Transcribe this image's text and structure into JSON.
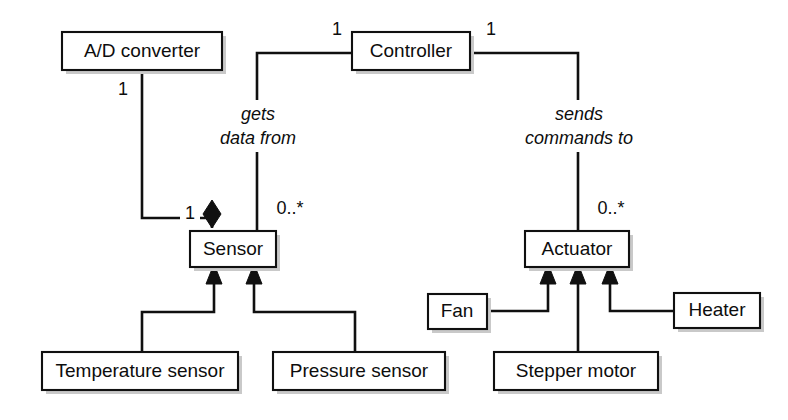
{
  "diagram": {
    "kind": "uml-class-diagram",
    "background_color": "#ffffff",
    "line_color": "#101010",
    "box_fill_color": "#ffffff",
    "text_color": "#0d0d0d"
  },
  "classes": [
    {
      "id": "ad_converter",
      "name": "A/D converter"
    },
    {
      "id": "controller",
      "name": "Controller"
    },
    {
      "id": "sensor",
      "name": "Sensor"
    },
    {
      "id": "actuator",
      "name": "Actuator"
    },
    {
      "id": "temperature_sensor",
      "name": "Temperature sensor"
    },
    {
      "id": "pressure_sensor",
      "name": "Pressure sensor"
    },
    {
      "id": "fan",
      "name": "Fan"
    },
    {
      "id": "stepper_motor",
      "name": "Stepper motor"
    },
    {
      "id": "heater",
      "name": "Heater"
    }
  ],
  "associations": [
    {
      "id": "ad_to_sensor",
      "type": "composition",
      "from": "A/D converter",
      "to": "Sensor",
      "source_multiplicity": "1",
      "target_multiplicity": "1",
      "label": ""
    },
    {
      "id": "controller_to_sensor",
      "type": "association",
      "from": "Controller",
      "to": "Sensor",
      "source_multiplicity": "1",
      "target_multiplicity": "0..*",
      "label_line1": "gets",
      "label_line2": "data from"
    },
    {
      "id": "controller_to_actuator",
      "type": "association",
      "from": "Controller",
      "to": "Actuator",
      "source_multiplicity": "1",
      "target_multiplicity": "0..*",
      "label_line1": "sends",
      "label_line2": "commands to"
    }
  ],
  "generalizations": [
    {
      "id": "temp_to_sensor",
      "subclass": "Temperature sensor",
      "superclass": "Sensor"
    },
    {
      "id": "press_to_sensor",
      "subclass": "Pressure sensor",
      "superclass": "Sensor"
    },
    {
      "id": "fan_to_actuator",
      "subclass": "Fan",
      "superclass": "Actuator"
    },
    {
      "id": "stepper_to_actuator",
      "subclass": "Stepper motor",
      "superclass": "Actuator"
    },
    {
      "id": "heater_to_actuator",
      "subclass": "Heater",
      "superclass": "Actuator"
    }
  ],
  "multiplicities": {
    "ad_converter_end": "1",
    "sensor_composition_end": "1",
    "controller_left_end": "1",
    "controller_right_end": "1",
    "sensor_assoc_end": "0..*",
    "actuator_assoc_end": "0..*"
  },
  "association_labels": {
    "gets_data_from_line1": "gets",
    "gets_data_from_line2": "data from",
    "sends_commands_to_line1": "sends",
    "sends_commands_to_line2": "commands to"
  }
}
